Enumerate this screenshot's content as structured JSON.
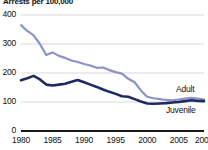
{
  "chart_data": {
    "type": "line",
    "title": "Arrests per 100,000",
    "xlabel": "",
    "ylabel": "",
    "ylim": [
      0,
      400
    ],
    "xlim": [
      1980,
      2009
    ],
    "grid": true,
    "grid_axis": "y",
    "legend_position": "inline-right",
    "yticks": [
      0,
      100,
      200,
      300,
      400
    ],
    "ytick_labels": [
      "0",
      "100",
      "200",
      "300",
      "400"
    ],
    "xticks": [
      1980,
      1985,
      1990,
      1995,
      2000,
      2005,
      2009
    ],
    "xtick_labels": [
      "1980",
      "1985",
      "1990",
      "1995",
      "2000",
      "2005",
      "2009"
    ],
    "x": [
      1980,
      1981,
      1982,
      1983,
      1984,
      1985,
      1986,
      1987,
      1988,
      1989,
      1990,
      1991,
      1992,
      1993,
      1994,
      1995,
      1996,
      1997,
      1998,
      1999,
      2000,
      2001,
      2002,
      2003,
      2004,
      2005,
      2006,
      2007,
      2008,
      2009
    ],
    "series": [
      {
        "name": "Adult",
        "color": "#8b93c4",
        "values": [
          365,
          345,
          330,
          300,
          262,
          271,
          259,
          252,
          243,
          238,
          231,
          226,
          218,
          219,
          210,
          203,
          198,
          180,
          168,
          140,
          118,
          113,
          110,
          107,
          106,
          108,
          112,
          114,
          112,
          108
        ]
      },
      {
        "name": "Juvenile",
        "color": "#1f2a63",
        "values": [
          175,
          182,
          190,
          178,
          160,
          157,
          160,
          163,
          170,
          176,
          168,
          160,
          152,
          143,
          135,
          128,
          120,
          118,
          110,
          102,
          95,
          94,
          95,
          96,
          98,
          100,
          103,
          106,
          104,
          103
        ]
      }
    ]
  },
  "labels": {
    "adult": "Adult",
    "juvenile": "Juvenile"
  }
}
